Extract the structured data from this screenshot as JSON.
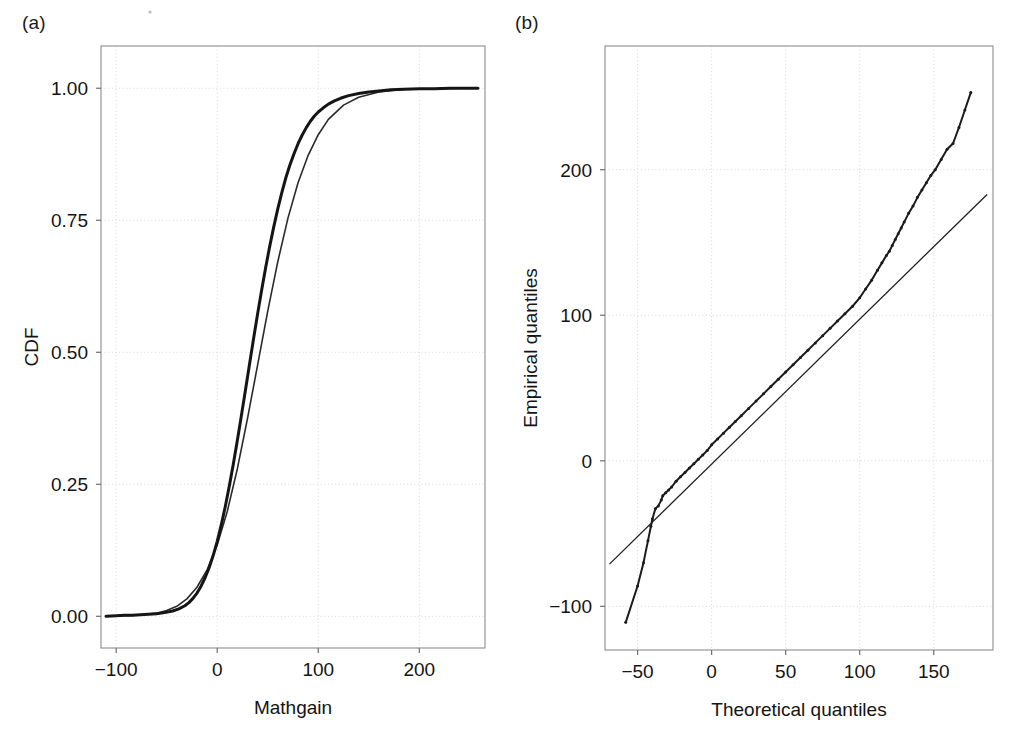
{
  "figure": {
    "panels": [
      {
        "tag": "(a)",
        "xlabel": "Mathgain",
        "ylabel": "CDF"
      },
      {
        "tag": "(b)",
        "xlabel": "Theoretical quantiles",
        "ylabel": "Empirical quantiles"
      }
    ],
    "colors": {
      "curve": "#151515",
      "grid": "#d8d8d8",
      "frame": "#8c8c8c",
      "text": "#141414",
      "background": "#ffffff"
    }
  },
  "chart_data": [
    {
      "type": "line",
      "panel": "(a)",
      "title": "",
      "subtitle": "",
      "xlabel": "Mathgain",
      "ylabel": "CDF",
      "xlim": [
        -115,
        265
      ],
      "ylim": [
        -0.06,
        1.08
      ],
      "xticks": [
        -100,
        0,
        100,
        200
      ],
      "xtick_labels": [
        "−100",
        "0",
        "100",
        "200"
      ],
      "yticks": [
        0.0,
        0.25,
        0.5,
        0.75,
        1.0
      ],
      "ytick_labels": [
        "0.00",
        "0.25",
        "0.50",
        "0.75",
        "1.00"
      ],
      "grid": true,
      "legend": "none",
      "annotations": [],
      "series": [
        {
          "name": "Empirical CDF of Mathgain",
          "x": [
            -110,
            -100,
            -92,
            -84,
            -76,
            -68,
            -60,
            -52,
            -44,
            -38,
            -32,
            -28,
            -24,
            -20,
            -16,
            -12,
            -8,
            -4,
            0,
            4,
            8,
            12,
            16,
            20,
            24,
            28,
            32,
            36,
            40,
            44,
            48,
            52,
            56,
            60,
            64,
            68,
            72,
            76,
            80,
            84,
            88,
            92,
            96,
            100,
            105,
            110,
            116,
            122,
            130,
            140,
            150,
            160,
            172,
            185,
            200,
            215,
            230,
            245,
            258
          ],
          "y": [
            0.0,
            0.001,
            0.002,
            0.002,
            0.003,
            0.004,
            0.005,
            0.007,
            0.01,
            0.014,
            0.02,
            0.026,
            0.034,
            0.044,
            0.057,
            0.073,
            0.092,
            0.115,
            0.142,
            0.173,
            0.208,
            0.247,
            0.289,
            0.334,
            0.381,
            0.429,
            0.478,
            0.526,
            0.573,
            0.618,
            0.661,
            0.701,
            0.738,
            0.772,
            0.803,
            0.831,
            0.855,
            0.876,
            0.895,
            0.911,
            0.925,
            0.937,
            0.947,
            0.955,
            0.963,
            0.97,
            0.976,
            0.981,
            0.986,
            0.99,
            0.993,
            0.995,
            0.997,
            0.998,
            0.999,
            0.999,
            1.0,
            1.0,
            1.0
          ]
        },
        {
          "name": "Fitted normal CDF (overlay)",
          "x": [
            -110,
            -100,
            -90,
            -80,
            -70,
            -60,
            -50,
            -40,
            -30,
            -20,
            -10,
            0,
            10,
            20,
            30,
            40,
            50,
            60,
            70,
            80,
            90,
            100,
            110,
            125,
            140,
            160,
            185,
            215,
            245,
            258
          ],
          "y": [
            0.0,
            0.001,
            0.001,
            0.002,
            0.004,
            0.006,
            0.011,
            0.019,
            0.033,
            0.055,
            0.088,
            0.135,
            0.199,
            0.28,
            0.375,
            0.476,
            0.578,
            0.672,
            0.754,
            0.821,
            0.873,
            0.912,
            0.941,
            0.968,
            0.983,
            0.993,
            0.998,
            0.999,
            1.0,
            1.0
          ]
        }
      ]
    },
    {
      "type": "scatter",
      "panel": "(b)",
      "title": "",
      "subtitle": "",
      "xlabel": "Theoretical quantiles",
      "ylabel": "Empirical quantiles",
      "xlim": [
        -72,
        190
      ],
      "ylim": [
        -130,
        285
      ],
      "xticks": [
        -50,
        0,
        50,
        100,
        150
      ],
      "xtick_labels": [
        "−50",
        "0",
        "50",
        "100",
        "150"
      ],
      "yticks": [
        -100,
        0,
        100,
        200
      ],
      "ytick_labels": [
        "−100",
        "0",
        "100",
        "200"
      ],
      "grid": true,
      "legend": "none",
      "annotations": [],
      "reference_line": {
        "name": "45-degree reference line",
        "x": [
          -69,
          186
        ],
        "y": [
          -71,
          183
        ]
      },
      "series": [
        {
          "name": "Q-Q sample points",
          "x": [
            -58,
            -50,
            -46,
            -43,
            -41,
            -40,
            -38,
            -36,
            -34,
            -33,
            -31,
            -29,
            -27,
            -24,
            -21,
            -18,
            -15,
            -12,
            -9,
            -6,
            -3,
            0,
            4,
            8,
            12,
            16,
            20,
            25,
            30,
            35,
            40,
            45,
            50,
            55,
            60,
            65,
            70,
            75,
            80,
            85,
            90,
            95,
            100,
            104,
            108,
            112,
            115,
            118,
            120,
            122,
            124,
            126,
            128,
            130,
            133,
            136,
            139,
            142,
            145,
            148,
            151,
            155,
            159,
            163,
            167,
            171,
            175
          ],
          "y": [
            -111,
            -86,
            -70,
            -55,
            -45,
            -40,
            -33,
            -31,
            -27,
            -24,
            -22,
            -20,
            -18,
            -14,
            -11,
            -8,
            -5,
            -2,
            1,
            4,
            7,
            11,
            15,
            19,
            23,
            27,
            31,
            36,
            41,
            46,
            51,
            56,
            61,
            66,
            71,
            76,
            81,
            86,
            91,
            96,
            101,
            106,
            112,
            118,
            124,
            131,
            136,
            141,
            144,
            148,
            152,
            156,
            160,
            164,
            170,
            175,
            181,
            186,
            191,
            196,
            200,
            207,
            214,
            218,
            229,
            241,
            253
          ]
        }
      ]
    }
  ]
}
